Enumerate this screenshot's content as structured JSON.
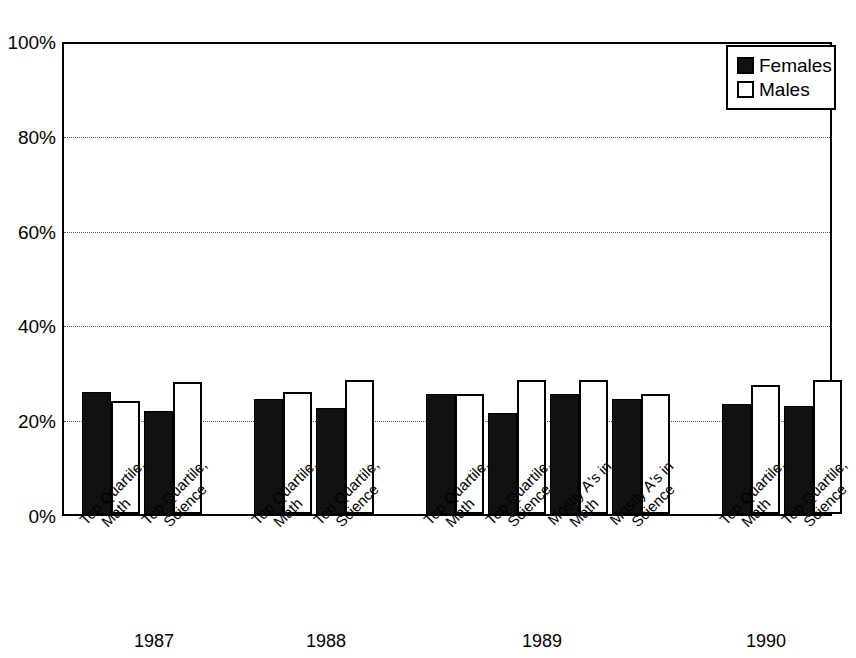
{
  "chart_data": {
    "type": "bar",
    "title": "",
    "subtitle": "",
    "xlabel": "",
    "ylabel": "",
    "ylim": [
      0,
      100
    ],
    "y_tick_labels": [
      "0%",
      "20%",
      "40%",
      "60%",
      "80%",
      "100%"
    ],
    "y_tick_values": [
      0,
      20,
      40,
      60,
      80,
      100
    ],
    "grid": "horizontal-dotted",
    "legend_position": "top-right",
    "legend": [
      {
        "name": "Females",
        "swatch": "black-filled"
      },
      {
        "name": "Males",
        "swatch": "white-outlined"
      }
    ],
    "series": [
      {
        "name": "Females",
        "values": [
          26,
          22,
          24.5,
          22.5,
          25.5,
          21.5,
          25.5,
          24.5,
          23.5,
          23
        ]
      },
      {
        "name": "Males",
        "values": [
          24,
          28,
          26,
          28.5,
          25.5,
          28.5,
          28.5,
          25.5,
          27.5,
          28.5
        ]
      }
    ],
    "categories": [
      "Top Quartile, Math",
      "Top Quartile, Science",
      "Top Quartile, Math",
      "Top Quartile, Science",
      "Top Quartile, Math",
      "Top Quartile, Science",
      "Mostly A's in Math",
      "Mostly A's in Science",
      "Top Quartile, Math",
      "Top Quartile, Science"
    ],
    "category_lines": [
      [
        "Top Quartile,",
        "Math"
      ],
      [
        "Top Quartile,",
        "Science"
      ],
      [
        "Top Quartile,",
        "Math"
      ],
      [
        "Top Quartile,",
        "Science"
      ],
      [
        "Top Quartile,",
        "Math"
      ],
      [
        "Top Quartile,",
        "Science"
      ],
      [
        "Mostly A's in",
        "Math"
      ],
      [
        "Mostly A's in",
        "Science"
      ],
      [
        "Top Quartile,",
        "Math"
      ],
      [
        "Top Quartile,",
        "Science"
      ]
    ],
    "groups": [
      {
        "label": "1987",
        "category_count": 2
      },
      {
        "label": "1988",
        "category_count": 2
      },
      {
        "label": "1989",
        "category_count": 4
      },
      {
        "label": "1990",
        "category_count": 2
      }
    ],
    "colors": {
      "females": "#111111",
      "males": "#ffffff",
      "axis": "#000000",
      "grid": "#555555",
      "background": "#ffffff"
    }
  },
  "layout": {
    "bar_slots_x": [
      {
        "female_left": 18,
        "male_left": 47
      },
      {
        "female_left": 80,
        "male_left": 109
      },
      {
        "female_left": 190,
        "male_left": 219
      },
      {
        "female_left": 252,
        "male_left": 281
      },
      {
        "female_left": 362,
        "male_left": 391
      },
      {
        "female_left": 424,
        "male_left": 453
      },
      {
        "female_left": 486,
        "male_left": 515
      },
      {
        "female_left": 548,
        "male_left": 577
      },
      {
        "female_left": 658,
        "male_left": 687
      },
      {
        "female_left": 720,
        "male_left": 749
      }
    ],
    "bar_width": 29,
    "label_anchor_x": [
      76,
      138,
      248,
      310,
      420,
      482,
      544,
      606,
      716,
      778
    ],
    "group_label_x": [
      154,
      326,
      542,
      766
    ],
    "group_label_y": 116,
    "legend": {
      "left": 726,
      "top": 45,
      "width": 110,
      "height": 65
    }
  }
}
